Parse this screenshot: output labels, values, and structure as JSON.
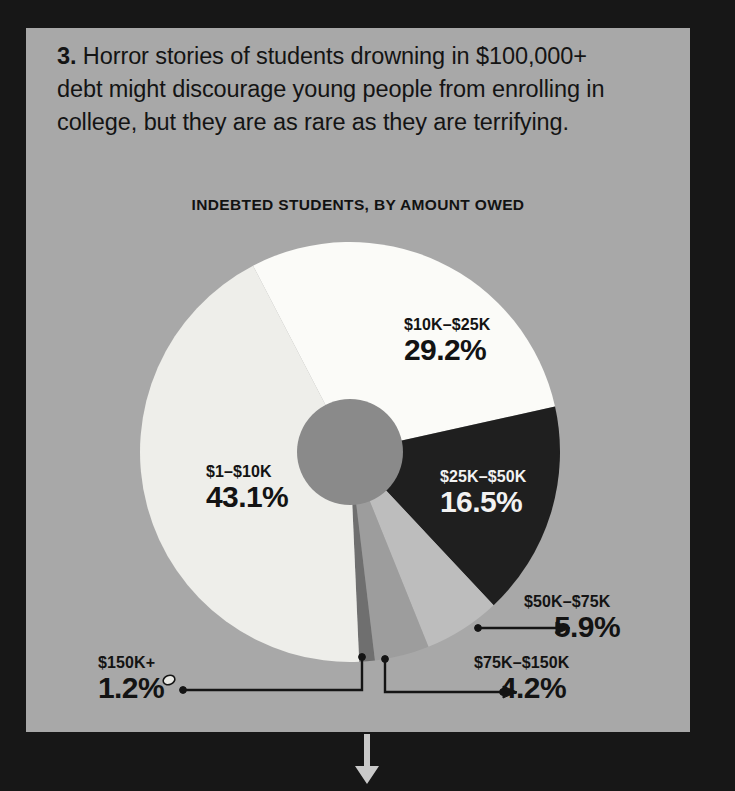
{
  "panel": {
    "item_number": "3.",
    "body_text": "Horror stories of students drowning in $100,000+ debt might discourage young people from enrolling in college, but they are as rare as they are terrifying.",
    "background_color": "#a8a8a8",
    "backdrop_color": "#171717"
  },
  "chart_data": {
    "type": "pie",
    "title": "INDEBTED STUDENTS, BY AMOUNT OWED",
    "xlabel": "",
    "ylabel": "",
    "units": "percent",
    "donut_hole": true,
    "legend": "labels on slices",
    "categories": [
      "$1–$10K",
      "$10K–$25K",
      "$25K–$50K",
      "$50K–$75K",
      "$75K–$150K",
      "$150K+"
    ],
    "values": [
      43.1,
      29.2,
      16.5,
      5.9,
      4.2,
      1.2
    ],
    "value_labels": [
      "43.1%",
      "29.2%",
      "16.5%",
      "5.9%",
      "4.2%",
      "1.2%"
    ],
    "slice_colors": [
      "#eeeeea",
      "#fbfbf8",
      "#1f1f1f",
      "#bdbdbd",
      "#9d9d9d",
      "#6f6f6f"
    ],
    "hub_color": "#8a8a8a",
    "slices": [
      {
        "label": "$1–$10K",
        "value": 43.1,
        "value_label": "43.1%",
        "color": "#eeeeea",
        "label_color": "#131313",
        "label_placement": "inside"
      },
      {
        "label": "$10K–$25K",
        "value": 29.2,
        "value_label": "29.2%",
        "color": "#fbfbf8",
        "label_color": "#131313",
        "label_placement": "inside"
      },
      {
        "label": "$25K–$50K",
        "value": 16.5,
        "value_label": "16.5%",
        "color": "#1f1f1f",
        "label_color": "#f2f2f2",
        "label_placement": "inside"
      },
      {
        "label": "$50K–$75K",
        "value": 5.9,
        "value_label": "5.9%",
        "color": "#bdbdbd",
        "label_color": "#131313",
        "label_placement": "callout"
      },
      {
        "label": "$75K–$150K",
        "value": 4.2,
        "value_label": "4.2%",
        "color": "#9d9d9d",
        "label_color": "#131313",
        "label_placement": "callout"
      },
      {
        "label": "$150K+",
        "value": 1.2,
        "value_label": "1.2%",
        "color": "#6f6f6f",
        "label_color": "#131313",
        "label_placement": "callout"
      }
    ]
  },
  "footer": {
    "arrow_icon": "down-arrow-icon",
    "arrow_color": "#c9c9c9"
  }
}
